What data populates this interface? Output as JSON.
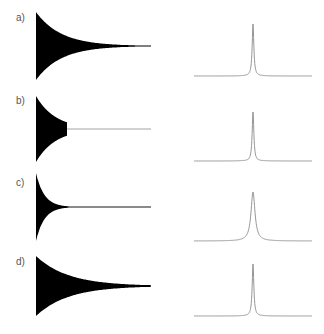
{
  "figure": {
    "width": 324,
    "height": 334,
    "background": "#ffffff",
    "waveform_color": "#000000",
    "spectrum_color": "#8a8a8a",
    "label_color": "#555555"
  },
  "chart_data": [
    {
      "panel": "a)",
      "type": "area",
      "title": "a) time-domain signal",
      "description": "Exponentially decaying oscillation, long slow decay tail",
      "xlabel": "",
      "ylabel": "",
      "grid": false,
      "decay": "exponential-slow",
      "truncated": false,
      "truncate_at": null,
      "relative_amplitude": [
        1.0,
        0.55,
        0.3,
        0.15,
        0.08,
        0.04,
        0.02,
        0.01
      ],
      "x": [
        0,
        0.14,
        0.28,
        0.42,
        0.56,
        0.7,
        0.85,
        1.0
      ]
    },
    {
      "panel": "a)",
      "type": "line",
      "title": "a) spectrum",
      "description": "Single narrow Lorentzian peak, clean baseline",
      "xlabel": "",
      "ylabel": "",
      "grid": false,
      "peak_position": 0.5,
      "peak_height": 1.0,
      "linewidth": "narrow",
      "sidelobes": false
    },
    {
      "panel": "b)",
      "type": "area",
      "title": "b) time-domain signal",
      "description": "Decaying oscillation abruptly truncated (~30% of record), then flat zero",
      "xlabel": "",
      "ylabel": "",
      "grid": false,
      "decay": "exponential-slow",
      "truncated": true,
      "truncate_at": 0.27,
      "relative_amplitude": [
        1.0,
        0.75,
        0.55,
        0.42,
        0,
        0,
        0,
        0
      ],
      "x": [
        0,
        0.09,
        0.18,
        0.27,
        0.28,
        0.5,
        0.75,
        1.0
      ]
    },
    {
      "panel": "b)",
      "type": "line",
      "title": "b) spectrum",
      "description": "Narrow peak with sinc-like truncation wiggles (sidelobes) at its base",
      "xlabel": "",
      "ylabel": "",
      "grid": false,
      "peak_position": 0.5,
      "peak_height": 0.9,
      "linewidth": "narrow",
      "sidelobes": true
    },
    {
      "panel": "c)",
      "type": "area",
      "title": "c) time-domain signal",
      "description": "Rapidly decaying oscillation reaching zero by ~30% of record",
      "xlabel": "",
      "ylabel": "",
      "grid": false,
      "decay": "exponential-fast",
      "truncated": false,
      "truncate_at": null,
      "relative_amplitude": [
        1.0,
        0.35,
        0.1,
        0.03,
        0.01,
        0,
        0,
        0
      ],
      "x": [
        0,
        0.07,
        0.14,
        0.21,
        0.28,
        0.5,
        0.75,
        1.0
      ]
    },
    {
      "panel": "c)",
      "type": "line",
      "title": "c) spectrum",
      "description": "Broader Lorentzian peak, smooth baseline",
      "xlabel": "",
      "ylabel": "",
      "grid": false,
      "peak_position": 0.5,
      "peak_height": 0.9,
      "linewidth": "broad",
      "sidelobes": false
    },
    {
      "panel": "d)",
      "type": "area",
      "title": "d) time-domain signal",
      "description": "Decaying oscillation with smooth (apodized) taper across full record",
      "xlabel": "",
      "ylabel": "",
      "grid": false,
      "decay": "exponential-moderate",
      "truncated": false,
      "truncate_at": null,
      "relative_amplitude": [
        1.0,
        0.6,
        0.38,
        0.24,
        0.15,
        0.09,
        0.05,
        0.03
      ],
      "x": [
        0,
        0.14,
        0.28,
        0.42,
        0.56,
        0.7,
        0.85,
        1.0
      ]
    },
    {
      "panel": "d)",
      "type": "line",
      "title": "d) spectrum",
      "description": "Narrow peak, clean baseline (no truncation artifacts)",
      "xlabel": "",
      "ylabel": "",
      "grid": false,
      "peak_position": 0.5,
      "peak_height": 1.0,
      "linewidth": "narrow",
      "sidelobes": false
    }
  ],
  "panels": [
    {
      "label": "a)"
    },
    {
      "label": "b)"
    },
    {
      "label": "c)"
    },
    {
      "label": "d)"
    }
  ]
}
